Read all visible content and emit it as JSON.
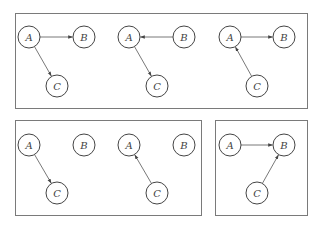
{
  "diagram": {
    "title": "",
    "panels": [
      {
        "name": "top-panel",
        "x": 15,
        "y": 13,
        "w": 292,
        "h": 95
      },
      {
        "name": "bottom-left-panel",
        "x": 15,
        "y": 120,
        "w": 186,
        "h": 95
      },
      {
        "name": "bottom-right-panel",
        "x": 215,
        "y": 120,
        "w": 92,
        "h": 95
      }
    ],
    "graphs": [
      {
        "name": "graph-1",
        "nodes": [
          {
            "id": "A",
            "label": "A",
            "x": 29,
            "y": 37
          },
          {
            "id": "B",
            "label": "B",
            "x": 84,
            "y": 37
          },
          {
            "id": "C",
            "label": "C",
            "x": 57,
            "y": 86
          }
        ],
        "edges": [
          {
            "from": "A",
            "to": "B"
          },
          {
            "from": "A",
            "to": "C"
          }
        ]
      },
      {
        "name": "graph-2",
        "nodes": [
          {
            "id": "A",
            "label": "A",
            "x": 129,
            "y": 37
          },
          {
            "id": "B",
            "label": "B",
            "x": 184,
            "y": 37
          },
          {
            "id": "C",
            "label": "C",
            "x": 157,
            "y": 86
          }
        ],
        "edges": [
          {
            "from": "B",
            "to": "A"
          },
          {
            "from": "A",
            "to": "C"
          }
        ]
      },
      {
        "name": "graph-3",
        "nodes": [
          {
            "id": "A",
            "label": "A",
            "x": 230,
            "y": 37
          },
          {
            "id": "B",
            "label": "B",
            "x": 284,
            "y": 37
          },
          {
            "id": "C",
            "label": "C",
            "x": 257,
            "y": 86
          }
        ],
        "edges": [
          {
            "from": "A",
            "to": "B"
          },
          {
            "from": "C",
            "to": "A"
          }
        ]
      },
      {
        "name": "graph-4",
        "nodes": [
          {
            "id": "A",
            "label": "A",
            "x": 29,
            "y": 145
          },
          {
            "id": "B",
            "label": "B",
            "x": 84,
            "y": 145
          },
          {
            "id": "C",
            "label": "C",
            "x": 57,
            "y": 193
          }
        ],
        "edges": [
          {
            "from": "A",
            "to": "C"
          }
        ]
      },
      {
        "name": "graph-5",
        "nodes": [
          {
            "id": "A",
            "label": "A",
            "x": 129,
            "y": 145
          },
          {
            "id": "B",
            "label": "B",
            "x": 184,
            "y": 145
          },
          {
            "id": "C",
            "label": "C",
            "x": 157,
            "y": 193
          }
        ],
        "edges": [
          {
            "from": "C",
            "to": "A"
          }
        ]
      },
      {
        "name": "graph-6",
        "nodes": [
          {
            "id": "A",
            "label": "A",
            "x": 230,
            "y": 145
          },
          {
            "id": "B",
            "label": "B",
            "x": 284,
            "y": 145
          },
          {
            "id": "C",
            "label": "C",
            "x": 257,
            "y": 193
          }
        ],
        "edges": [
          {
            "from": "A",
            "to": "B"
          },
          {
            "from": "C",
            "to": "B"
          }
        ]
      }
    ],
    "node_radius": 11,
    "colors": {
      "stroke": "#444444",
      "panel": "#7a7a7a",
      "background": "#ffffff"
    }
  }
}
